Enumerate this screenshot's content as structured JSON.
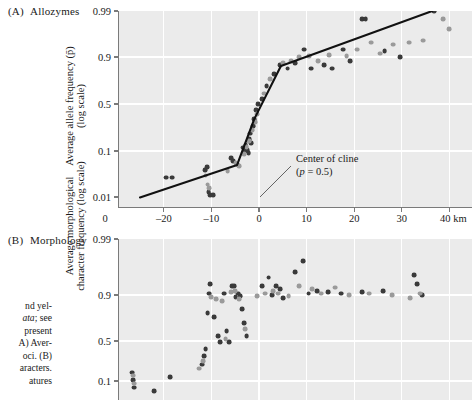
{
  "figure": {
    "panels": [
      {
        "key": "A",
        "letter": "(A)",
        "title": "Allozymes",
        "ytitle_line1": "Average allele frequency (p̄)",
        "ytitle_line2": "(log scale)",
        "y_ticks": [
          "0.99",
          "0.9",
          "0.5",
          "0.1",
          "0.01"
        ],
        "x_ticks": [
          "–20",
          "–10",
          "0",
          "10",
          "20",
          "30",
          "40 km"
        ],
        "x_left_label": "0"
      },
      {
        "key": "B",
        "letter": "(B)",
        "title": "Morphology",
        "ytitle_line1": "Average morphological",
        "ytitle_line2": "character frequency (log scale)",
        "y_ticks": [
          "0.99",
          "0.9",
          "0.5",
          "0.1"
        ]
      }
    ],
    "annotation": {
      "line1": "Center of cline",
      "line2_pre": "(",
      "line2_ital": "p",
      "line2_post": " = 0.5)"
    },
    "caption_lines": [
      "nd yel-",
      "ata; see",
      "present",
      "A) Aver-",
      "oci. (B)",
      "aracters.",
      "atures"
    ],
    "colors": {
      "plot_background": "#ebebeb",
      "gridline": "#ffffff",
      "axis": "#7a7a7a",
      "point_dark": "#3a3a3a",
      "point_light": "#9a9a9a",
      "fit_line": "#111111",
      "text": "#1a1a1a"
    }
  },
  "chart_data": [
    {
      "type": "scatter",
      "panel": "A",
      "title": "(A) Allozymes",
      "xlabel": "Distance (km)",
      "ylabel": "Average allele frequency (p̄) (log scale)",
      "xlim": [
        -27,
        42
      ],
      "ylim_labels": [
        "0.01",
        "0.1",
        "0.5",
        "0.9",
        "0.99"
      ],
      "grid": true,
      "legend": "none",
      "series": [
        {
          "name": "dark-points",
          "color": "#3a3a3a",
          "points": [
            [
              -19.6,
              0.027
            ],
            [
              -18.3,
              0.027
            ],
            [
              -11.4,
              0.04
            ],
            [
              -10.9,
              0.045
            ],
            [
              -10.6,
              0.013
            ],
            [
              -10.2,
              0.011
            ],
            [
              -9.6,
              0.011
            ],
            [
              -5.9,
              0.07
            ],
            [
              -5.4,
              0.062
            ],
            [
              -4.6,
              0.052
            ],
            [
              -3.4,
              0.115
            ],
            [
              -3.0,
              0.1
            ],
            [
              -2.8,
              0.13
            ],
            [
              -2.5,
              0.105
            ],
            [
              -2.2,
              0.092
            ],
            [
              -2.0,
              0.16
            ],
            [
              -1.8,
              0.2
            ],
            [
              -1.6,
              0.14
            ],
            [
              -1.3,
              0.26
            ],
            [
              -1.0,
              0.33
            ],
            [
              -0.6,
              0.43
            ],
            [
              -0.2,
              0.5
            ],
            [
              0.6,
              0.56
            ],
            [
              1.6,
              0.7
            ],
            [
              3.2,
              0.8
            ],
            [
              4.4,
              0.86
            ],
            [
              6.0,
              0.84
            ],
            [
              7.6,
              0.87
            ],
            [
              9.4,
              0.93
            ],
            [
              11.0,
              0.84
            ],
            [
              13.6,
              0.86
            ],
            [
              15.4,
              0.84
            ],
            [
              17.6,
              0.93
            ],
            [
              19.2,
              0.88
            ],
            [
              21.6,
              0.985
            ],
            [
              22.4,
              0.985
            ],
            [
              26.4,
              0.925
            ],
            [
              29.6,
              0.9
            ],
            [
              36.8,
              0.99
            ]
          ]
        },
        {
          "name": "light-points",
          "color": "#9a9a9a",
          "points": [
            [
              -11.2,
              0.03
            ],
            [
              -10.8,
              0.019
            ],
            [
              -10.4,
              0.016
            ],
            [
              -6.6,
              0.038
            ],
            [
              -4.9,
              0.055
            ],
            [
              -4.2,
              0.048
            ],
            [
              -3.2,
              0.088
            ],
            [
              -2.6,
              0.118
            ],
            [
              -2.1,
              0.15
            ],
            [
              -1.4,
              0.23
            ],
            [
              -0.9,
              0.3
            ],
            [
              -0.4,
              0.38
            ],
            [
              1.0,
              0.62
            ],
            [
              2.4,
              0.76
            ],
            [
              5.0,
              0.87
            ],
            [
              6.8,
              0.88
            ],
            [
              8.4,
              0.9
            ],
            [
              10.6,
              0.905
            ],
            [
              12.4,
              0.88
            ],
            [
              14.8,
              0.91
            ],
            [
              18.4,
              0.905
            ],
            [
              20.6,
              0.93
            ],
            [
              23.6,
              0.95
            ],
            [
              25.4,
              0.915
            ],
            [
              28.2,
              0.945
            ],
            [
              31.6,
              0.95
            ],
            [
              34.4,
              0.955
            ],
            [
              38.6,
              0.985
            ],
            [
              40.0,
              0.975
            ]
          ]
        }
      ],
      "fit_line": {
        "name": "cline-fit",
        "type": "piecewise-linear",
        "vertices": [
          [
            -25.0,
            0.0098
          ],
          [
            -4.6,
            0.051
          ],
          [
            -1.0,
            0.33
          ],
          [
            4.6,
            0.855
          ],
          [
            36.4,
            0.99
          ]
        ]
      },
      "annotations": [
        {
          "text": "Center of cline (p = 0.5)",
          "anchor_x": 0.2,
          "anchor_y": 0.012
        }
      ]
    },
    {
      "type": "scatter",
      "panel": "B",
      "title": "(B) Morphology",
      "xlabel": "Distance (km)",
      "ylabel": "Average morphological character frequency (log scale)",
      "xlim": [
        -27,
        42
      ],
      "ylim_labels": [
        "0.1",
        "0.5",
        "0.9",
        "0.99"
      ],
      "grid": true,
      "legend": "none",
      "series": [
        {
          "name": "dark-points",
          "color": "#3a3a3a",
          "points": [
            [
              -26.6,
              0.15
            ],
            [
              -26.4,
              0.105
            ],
            [
              -26.2,
              0.072
            ],
            [
              -22.0,
              0.06
            ],
            [
              -18.6,
              0.12
            ],
            [
              -12.0,
              0.215
            ],
            [
              -11.6,
              0.3
            ],
            [
              -11.2,
              0.39
            ],
            [
              -10.8,
              0.79
            ],
            [
              -10.5,
              0.905
            ],
            [
              -10.2,
              0.935
            ],
            [
              -9.4,
              0.76
            ],
            [
              -8.6,
              0.56
            ],
            [
              -8.2,
              0.48
            ],
            [
              -7.4,
              0.905
            ],
            [
              -6.8,
              0.62
            ],
            [
              -6.2,
              0.48
            ],
            [
              -5.6,
              0.93
            ],
            [
              -5.2,
              0.93
            ],
            [
              -4.9,
              0.89
            ],
            [
              -4.4,
              0.905
            ],
            [
              -4.0,
              0.895
            ],
            [
              -3.6,
              0.82
            ],
            [
              -3.2,
              0.7
            ],
            [
              -2.6,
              0.56
            ],
            [
              0.6,
              0.93
            ],
            [
              2.0,
              0.95
            ],
            [
              2.8,
              0.9
            ],
            [
              3.6,
              0.93
            ],
            [
              4.4,
              0.92
            ],
            [
              5.0,
              0.885
            ],
            [
              7.6,
              0.96
            ],
            [
              9.2,
              0.975
            ],
            [
              10.4,
              0.905
            ],
            [
              12.2,
              0.915
            ],
            [
              14.6,
              0.91
            ],
            [
              17.2,
              0.905
            ],
            [
              21.6,
              0.91
            ],
            [
              26.0,
              0.915
            ],
            [
              32.6,
              0.955
            ],
            [
              33.2,
              0.935
            ],
            [
              34.2,
              0.9
            ]
          ]
        },
        {
          "name": "light-points",
          "color": "#9a9a9a",
          "points": [
            [
              -26.5,
              0.13
            ],
            [
              -26.3,
              0.088
            ],
            [
              -12.6,
              0.18
            ],
            [
              -11.8,
              0.25
            ],
            [
              -10.0,
              0.89
            ],
            [
              -9.0,
              0.88
            ],
            [
              -7.8,
              0.87
            ],
            [
              -7.0,
              0.52
            ],
            [
              -5.8,
              0.91
            ],
            [
              -5.0,
              0.915
            ],
            [
              -4.2,
              0.88
            ],
            [
              -3.0,
              0.64
            ],
            [
              -0.4,
              0.895
            ],
            [
              1.2,
              0.905
            ],
            [
              3.0,
              0.915
            ],
            [
              4.0,
              0.905
            ],
            [
              6.2,
              0.895
            ],
            [
              8.4,
              0.93
            ],
            [
              11.2,
              0.92
            ],
            [
              13.0,
              0.905
            ],
            [
              16.0,
              0.925
            ],
            [
              19.0,
              0.9
            ],
            [
              23.2,
              0.905
            ],
            [
              28.0,
              0.9
            ],
            [
              31.8,
              0.885
            ],
            [
              33.8,
              0.905
            ]
          ]
        }
      ]
    }
  ]
}
